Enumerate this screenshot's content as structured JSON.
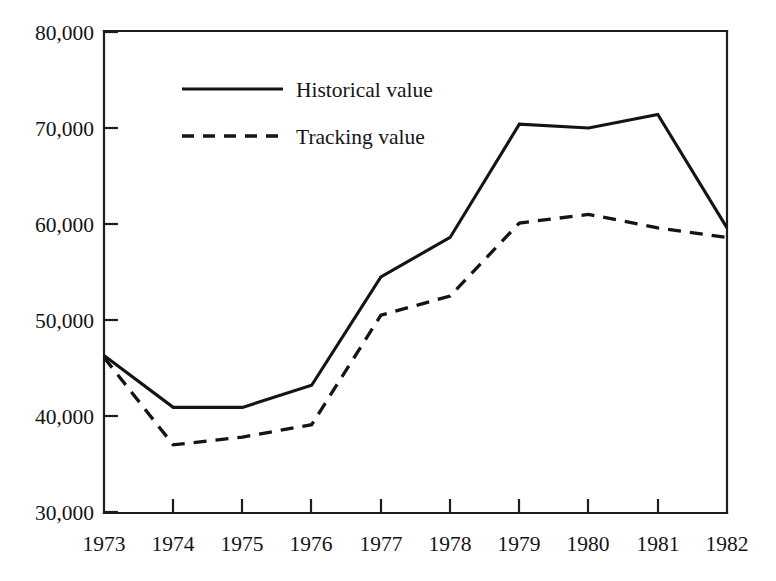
{
  "chart_data": {
    "type": "line",
    "title": "",
    "subtitle": "",
    "xlabel": "",
    "ylabel": "",
    "categories": [
      "1973",
      "1974",
      "1975",
      "1976",
      "1977",
      "1978",
      "1979",
      "1980",
      "1981",
      "1982"
    ],
    "x": [
      1973,
      1974,
      1975,
      1976,
      1977,
      1978,
      1979,
      1980,
      1981,
      1982
    ],
    "series": [
      {
        "name": "Historical value",
        "style": "solid",
        "color": "#141414",
        "values": [
          46300,
          40900,
          40900,
          43200,
          54500,
          58600,
          70400,
          70000,
          71400,
          59600
        ]
      },
      {
        "name": "Tracking value",
        "style": "dashed",
        "color": "#141414",
        "values": [
          46100,
          37000,
          37800,
          39100,
          50500,
          52500,
          60100,
          61000,
          59600,
          58600
        ]
      }
    ],
    "ylim": [
      30000,
      80000
    ],
    "ytick_values": [
      30000,
      40000,
      50000,
      60000,
      70000,
      80000
    ],
    "ytick_labels": [
      "30,000",
      "40,000",
      "50,000",
      "60,000",
      "70,000",
      "80,000"
    ],
    "xtick_labels": [
      "1973",
      "1974",
      "1975",
      "1976",
      "1977",
      "1978",
      "1979",
      "1980",
      "1981",
      "1982"
    ],
    "grid": false,
    "legend_position": "top-center-left",
    "legend_entries": [
      {
        "label": "Historical value",
        "style": "solid"
      },
      {
        "label": "Tracking value",
        "style": "dashed"
      }
    ],
    "axis_color": "#1d1d1d",
    "background_color": "#ffffff"
  }
}
